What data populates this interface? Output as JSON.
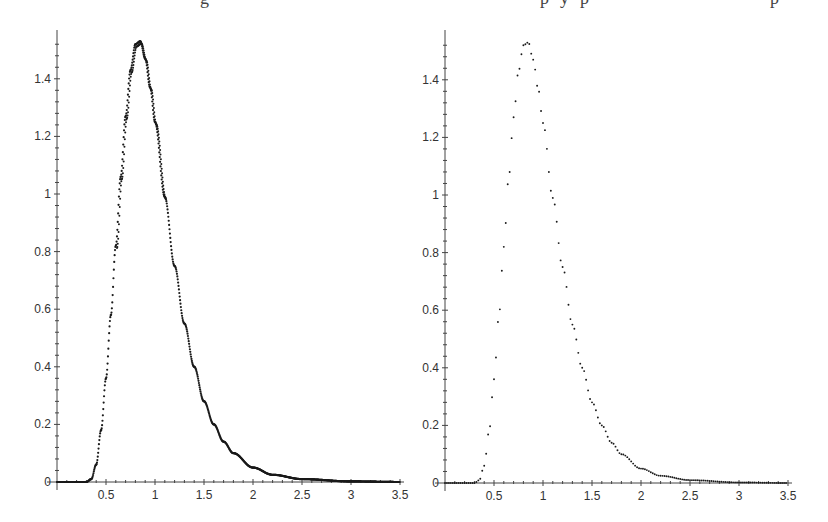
{
  "chart_data": [
    {
      "type": "scatter",
      "title": "",
      "xlabel": "",
      "ylabel": "",
      "xlim": [
        0,
        3.5
      ],
      "ylim": [
        0,
        1.55
      ],
      "grid": false,
      "legend": null,
      "x_ticks": [
        "0.5",
        "1",
        "1.5",
        "2",
        "2.5",
        "3",
        "3.5"
      ],
      "y_ticks": [
        "0",
        "0.2",
        "0.4",
        "0.6",
        "0.8",
        "1",
        "1.2",
        "1.4"
      ],
      "description": "Dense point plot (many overlapping samples) of a unimodal right-skewed density",
      "series": [
        {
          "name": "dense points",
          "peak_x": 0.82,
          "peak_y": 1.54,
          "onset_x": 0.35,
          "points": [
            [
              0.0,
              0.0
            ],
            [
              0.1,
              0.0
            ],
            [
              0.2,
              0.0
            ],
            [
              0.3,
              0.0
            ],
            [
              0.35,
              0.01
            ],
            [
              0.4,
              0.06
            ],
            [
              0.45,
              0.18
            ],
            [
              0.5,
              0.36
            ],
            [
              0.55,
              0.58
            ],
            [
              0.6,
              0.82
            ],
            [
              0.65,
              1.06
            ],
            [
              0.7,
              1.27
            ],
            [
              0.75,
              1.43
            ],
            [
              0.8,
              1.52
            ],
            [
              0.85,
              1.53
            ],
            [
              0.9,
              1.47
            ],
            [
              0.95,
              1.37
            ],
            [
              1.0,
              1.25
            ],
            [
              1.1,
              0.99
            ],
            [
              1.2,
              0.75
            ],
            [
              1.3,
              0.55
            ],
            [
              1.4,
              0.4
            ],
            [
              1.5,
              0.28
            ],
            [
              1.6,
              0.2
            ],
            [
              1.7,
              0.14
            ],
            [
              1.8,
              0.1
            ],
            [
              2.0,
              0.05
            ],
            [
              2.2,
              0.025
            ],
            [
              2.5,
              0.01
            ],
            [
              3.0,
              0.002
            ],
            [
              3.5,
              0.0
            ]
          ]
        }
      ]
    },
    {
      "type": "scatter",
      "title": "",
      "xlabel": "",
      "ylabel": "",
      "xlim": [
        0,
        3.5
      ],
      "ylim": [
        0,
        1.55
      ],
      "grid": false,
      "legend": null,
      "x_ticks": [
        "0.5",
        "1",
        "1.5",
        "2",
        "2.5",
        "3",
        "3.5"
      ],
      "y_ticks": [
        "0",
        "0.2",
        "0.4",
        "0.6",
        "0.8",
        "1",
        "1.2",
        "1.4"
      ],
      "description": "Sparse point plot of the same unimodal right-skewed density, evenly spaced samples",
      "series": [
        {
          "name": "sparse points",
          "peak_x": 0.82,
          "peak_y": 1.53,
          "onset_x": 0.35,
          "points": [
            [
              0.0,
              0.0
            ],
            [
              0.1,
              0.0
            ],
            [
              0.2,
              0.0
            ],
            [
              0.3,
              0.0
            ],
            [
              0.35,
              0.01
            ],
            [
              0.4,
              0.06
            ],
            [
              0.45,
              0.18
            ],
            [
              0.5,
              0.36
            ],
            [
              0.55,
              0.58
            ],
            [
              0.6,
              0.82
            ],
            [
              0.65,
              1.06
            ],
            [
              0.7,
              1.27
            ],
            [
              0.75,
              1.43
            ],
            [
              0.8,
              1.52
            ],
            [
              0.85,
              1.53
            ],
            [
              0.9,
              1.47
            ],
            [
              0.95,
              1.37
            ],
            [
              1.0,
              1.25
            ],
            [
              1.1,
              0.99
            ],
            [
              1.2,
              0.75
            ],
            [
              1.3,
              0.55
            ],
            [
              1.4,
              0.4
            ],
            [
              1.5,
              0.28
            ],
            [
              1.6,
              0.2
            ],
            [
              1.7,
              0.14
            ],
            [
              1.8,
              0.1
            ],
            [
              2.0,
              0.05
            ],
            [
              2.2,
              0.025
            ],
            [
              2.5,
              0.01
            ],
            [
              3.0,
              0.002
            ],
            [
              3.5,
              0.0
            ]
          ]
        }
      ]
    }
  ],
  "layout": {
    "panels": [
      {
        "x0": 57,
        "x1": 400,
        "y0": 482,
        "y_top": 30,
        "density": "dense"
      },
      {
        "x0": 445,
        "x1": 788,
        "y0": 483,
        "y_top": 30,
        "density": "sparse"
      }
    ],
    "px_per_y": 288,
    "dot_color": "#1a1a1a",
    "axis_color": "#444444"
  },
  "page_fragment": {
    "top_text_cut": "g                                              p y p         p"
  }
}
